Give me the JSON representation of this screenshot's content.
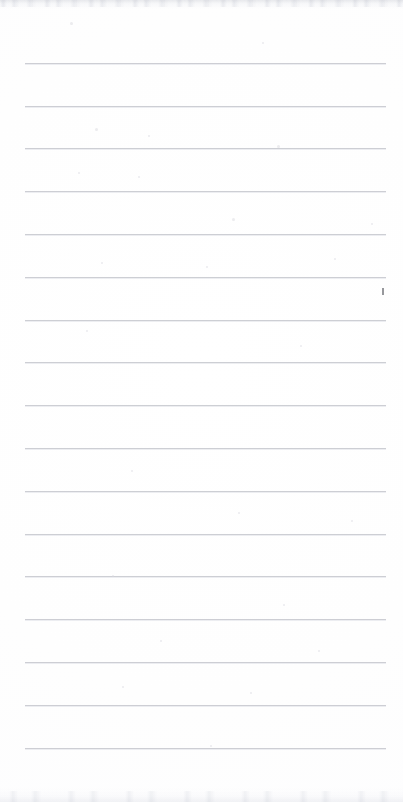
{
  "document": {
    "kind": "scanned-lined-notepad-page",
    "title": "Blank ruled notepad page",
    "page_width": 403,
    "page_height": 802,
    "text_content": "",
    "handwriting_present": "no",
    "printed_text_present": "no",
    "orientation": "portrait",
    "paper_color": "#fefeff",
    "rule_color": "#c9cbd1",
    "rule_count": 17,
    "rule_left": 25,
    "rule_right": 386,
    "rule_length": 361,
    "rule_thickness": 1,
    "rule_first_y": 63,
    "rule_spacing": 42.8,
    "margin_rule_present": "no",
    "header_area_height": 63
  },
  "rules": [
    {
      "index": 1,
      "y": 63,
      "left": 25,
      "width": 361
    },
    {
      "index": 2,
      "y": 106,
      "left": 25,
      "width": 361
    },
    {
      "index": 3,
      "y": 148,
      "left": 25,
      "width": 361
    },
    {
      "index": 4,
      "y": 191,
      "left": 25,
      "width": 361
    },
    {
      "index": 5,
      "y": 234,
      "left": 25,
      "width": 361
    },
    {
      "index": 6,
      "y": 277,
      "left": 25,
      "width": 361
    },
    {
      "index": 7,
      "y": 320,
      "left": 25,
      "width": 361
    },
    {
      "index": 8,
      "y": 362,
      "left": 25,
      "width": 361
    },
    {
      "index": 9,
      "y": 405,
      "left": 25,
      "width": 361
    },
    {
      "index": 10,
      "y": 448,
      "left": 25,
      "width": 361
    },
    {
      "index": 11,
      "y": 491,
      "left": 25,
      "width": 361
    },
    {
      "index": 12,
      "y": 534,
      "left": 25,
      "width": 361
    },
    {
      "index": 13,
      "y": 576,
      "left": 25,
      "width": 361
    },
    {
      "index": 14,
      "y": 619,
      "left": 25,
      "width": 361
    },
    {
      "index": 15,
      "y": 662,
      "left": 25,
      "width": 361
    },
    {
      "index": 16,
      "y": 705,
      "left": 25,
      "width": 361
    },
    {
      "index": 17,
      "y": 748,
      "left": 25,
      "width": 361
    }
  ],
  "artifacts": {
    "scan_edge_top": {
      "height": 9,
      "color": "#d6d8de"
    },
    "scan_edge_bottom": {
      "height": 14,
      "color": "#e2e4ea"
    },
    "ink_speck": {
      "x": 382,
      "y": 288,
      "width": 2,
      "height": 7,
      "color": "#6f7076"
    },
    "specks": [
      {
        "x": 70,
        "y": 22,
        "size": 3
      },
      {
        "x": 262,
        "y": 42,
        "size": 2
      },
      {
        "x": 95,
        "y": 128,
        "size": 3
      },
      {
        "x": 148,
        "y": 135,
        "size": 2
      },
      {
        "x": 277,
        "y": 145,
        "size": 3
      },
      {
        "x": 78,
        "y": 172,
        "size": 2
      },
      {
        "x": 138,
        "y": 176,
        "size": 2
      },
      {
        "x": 232,
        "y": 218,
        "size": 3
      },
      {
        "x": 371,
        "y": 223,
        "size": 2
      },
      {
        "x": 101,
        "y": 262,
        "size": 2
      },
      {
        "x": 206,
        "y": 266,
        "size": 2
      },
      {
        "x": 334,
        "y": 258,
        "size": 2
      },
      {
        "x": 86,
        "y": 330,
        "size": 2
      },
      {
        "x": 300,
        "y": 345,
        "size": 2
      },
      {
        "x": 131,
        "y": 470,
        "size": 2
      },
      {
        "x": 238,
        "y": 512,
        "size": 2
      },
      {
        "x": 351,
        "y": 520,
        "size": 2
      },
      {
        "x": 112,
        "y": 575,
        "size": 2
      },
      {
        "x": 283,
        "y": 604,
        "size": 2
      },
      {
        "x": 160,
        "y": 640,
        "size": 2
      },
      {
        "x": 318,
        "y": 650,
        "size": 2
      },
      {
        "x": 122,
        "y": 686,
        "size": 2
      },
      {
        "x": 250,
        "y": 692,
        "size": 2
      },
      {
        "x": 210,
        "y": 745,
        "size": 2
      }
    ]
  }
}
